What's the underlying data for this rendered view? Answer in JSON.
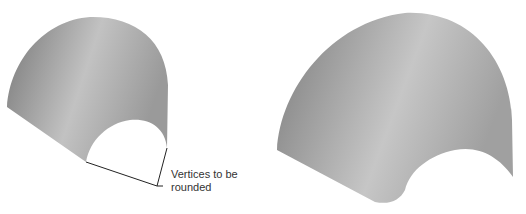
{
  "figure": {
    "left_shape": {
      "description": "surface with sharp vertices"
    },
    "right_shape": {
      "description": "surface with rounded vertices"
    },
    "annotation": {
      "line1": "Vertices to be",
      "line2": "rounded"
    }
  },
  "colors": {
    "surface_dark": "#7a7a7a",
    "surface_light": "#c4c4c4",
    "outline": "#222222"
  }
}
